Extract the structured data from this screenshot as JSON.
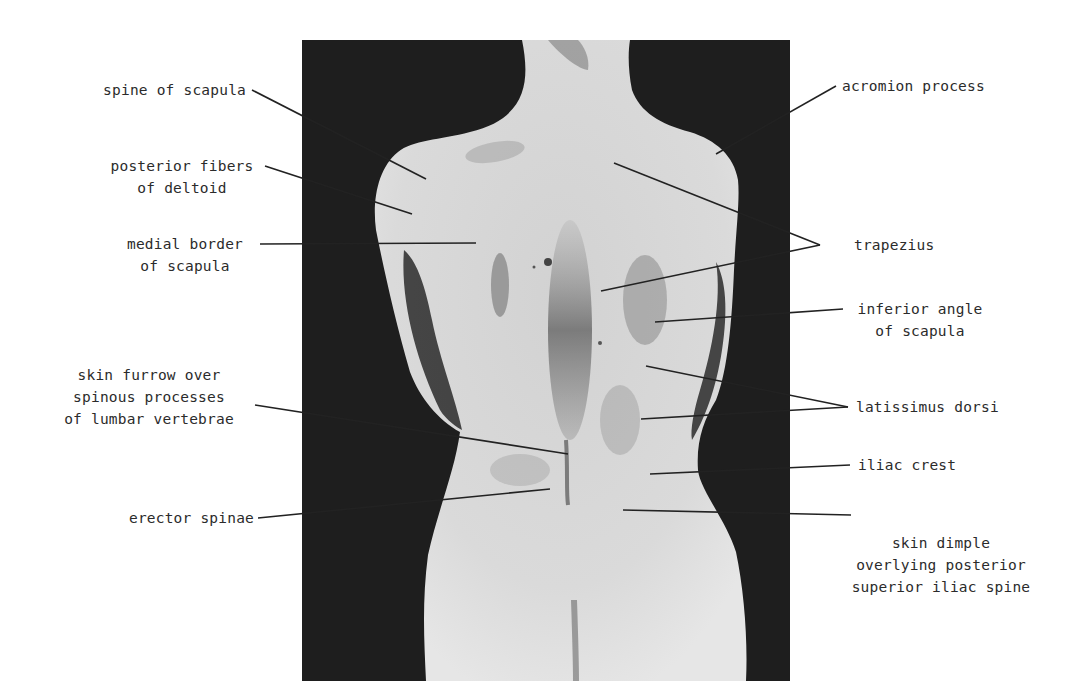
{
  "figure": {
    "photo": {
      "x": 302,
      "y": 40,
      "width": 488,
      "height": 641,
      "background": "#1c1c1c",
      "skin": "#dcdcdc"
    }
  },
  "labels_left": [
    {
      "id": "spine-of-scapula",
      "lines": [
        "spine of scapula"
      ]
    },
    {
      "id": "posterior-fibers-of-deltoid",
      "lines": [
        "posterior fibers",
        "of deltoid"
      ]
    },
    {
      "id": "medial-border-of-scapula",
      "lines": [
        "medial border",
        "of scapula"
      ]
    },
    {
      "id": "skin-furrow",
      "lines": [
        "skin furrow over",
        "spinous processes",
        "of lumbar vertebrae"
      ]
    },
    {
      "id": "erector-spinae",
      "lines": [
        "erector spinae"
      ]
    }
  ],
  "labels_right": [
    {
      "id": "acromion-process",
      "lines": [
        "acromion process"
      ]
    },
    {
      "id": "trapezius",
      "lines": [
        "trapezius"
      ]
    },
    {
      "id": "inferior-angle-of-scapula",
      "lines": [
        "inferior angle",
        "of scapula"
      ]
    },
    {
      "id": "latissimus-dorsi",
      "lines": [
        "latissimus dorsi"
      ]
    },
    {
      "id": "iliac-crest",
      "lines": [
        "iliac crest"
      ]
    },
    {
      "id": "skin-dimple",
      "lines": [
        "skin dimple",
        "overlying posterior",
        "superior iliac spine"
      ]
    }
  ],
  "text": {
    "spine_of_scapula": "spine of scapula",
    "posterior_fibers": "posterior fibers\nof deltoid",
    "medial_border": "medial border\nof scapula",
    "skin_furrow": "skin furrow over\nspinous processes\nof lumbar vertebrae",
    "erector_spinae": "erector spinae",
    "acromion_process": "acromion process",
    "trapezius": "trapezius",
    "inferior_angle": "inferior angle\nof scapula",
    "latissimus_dorsi": "latissimus dorsi",
    "iliac_crest": "iliac crest",
    "skin_dimple": "skin dimple\noverlying posterior\nsuperior iliac spine"
  }
}
